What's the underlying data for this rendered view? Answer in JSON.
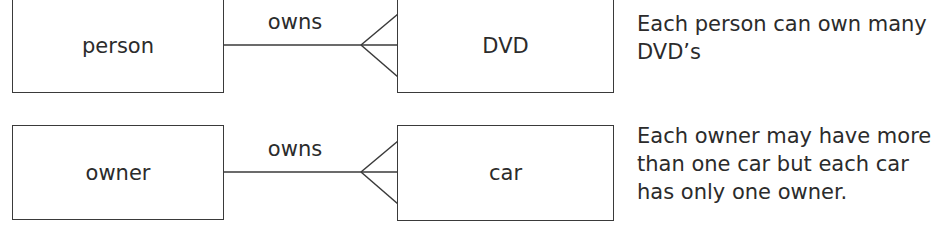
{
  "diagram": {
    "type": "entity-relationship",
    "notation": "crow's foot",
    "relationships": [
      {
        "left_entity": "person",
        "right_entity": "DVD",
        "label": "owns",
        "cardinality": "one-to-many",
        "description": "Each person can own many DVD’s"
      },
      {
        "left_entity": "owner",
        "right_entity": "car",
        "label": "owns",
        "cardinality": "one-to-many",
        "description": "Each owner may have more than one car but each car has only one owner."
      }
    ]
  },
  "colors": {
    "stroke": "#3a3a3a",
    "text": "#2b2b2b",
    "background": "#ffffff"
  }
}
